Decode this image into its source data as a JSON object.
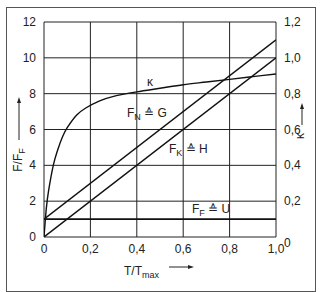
{
  "chart_data": {
    "type": "line",
    "title": "",
    "xlabel": "T/T",
    "xlabel_sub": "max",
    "ylabel_left": "F/F",
    "ylabel_left_sub": "F",
    "ylabel_right": "κ",
    "xlim": [
      0,
      1.0
    ],
    "ylim_left": [
      0,
      12
    ],
    "ylim_right": [
      0,
      1.2
    ],
    "grid": true,
    "x_ticks": [
      "0",
      "0,2",
      "0,4",
      "0,6",
      "0,8",
      "1,0"
    ],
    "x_tick_values": [
      0,
      0.2,
      0.4,
      0.6,
      0.8,
      1.0
    ],
    "y_left_ticks": [
      "0",
      "2",
      "4",
      "6",
      "8",
      "10",
      "12"
    ],
    "y_left_tick_values": [
      0,
      2,
      4,
      6,
      8,
      10,
      12
    ],
    "y_right_ticks": [
      "0",
      "0,2",
      "0,4",
      "0,6",
      "0,8",
      "1,0",
      "1,2"
    ],
    "y_right_tick_values": [
      0,
      0.2,
      0.4,
      0.6,
      0.8,
      1.0,
      1.2
    ],
    "series": [
      {
        "name": "κ",
        "axis": "right",
        "x": [
          0,
          0.01,
          0.02,
          0.04,
          0.06,
          0.08,
          0.1,
          0.14,
          0.18,
          0.24,
          0.3,
          0.4,
          0.5,
          0.6,
          0.7,
          0.8,
          0.9,
          1.0
        ],
        "values": [
          0,
          0.16,
          0.26,
          0.4,
          0.49,
          0.56,
          0.61,
          0.68,
          0.72,
          0.76,
          0.785,
          0.81,
          0.83,
          0.85,
          0.865,
          0.88,
          0.895,
          0.91
        ]
      },
      {
        "name": "F_N ≙ G",
        "label_main": "F",
        "label_sub": "N",
        "label_rest": " ≙ G",
        "axis": "left",
        "x": [
          0,
          1.0
        ],
        "values": [
          1,
          11
        ]
      },
      {
        "name": "F_K ≙ H",
        "label_main": "F",
        "label_sub": "K",
        "label_rest": " ≙ H",
        "axis": "left",
        "x": [
          0,
          1.0
        ],
        "values": [
          0,
          10
        ]
      },
      {
        "name": "F_F ≙ U",
        "label_main": "F",
        "label_sub": "F",
        "label_rest": " ≙ U",
        "axis": "left",
        "x": [
          0,
          1.0
        ],
        "values": [
          1,
          1
        ]
      }
    ],
    "annotations": [
      {
        "text": "κ",
        "series": "κ"
      },
      {
        "text": "F_N ≙ G",
        "series": "F_N ≙ G"
      },
      {
        "text": "F_K ≙ H",
        "series": "F_K ≙ H"
      },
      {
        "text": "F_F ≙ U",
        "series": "F_F ≙ U"
      }
    ]
  }
}
